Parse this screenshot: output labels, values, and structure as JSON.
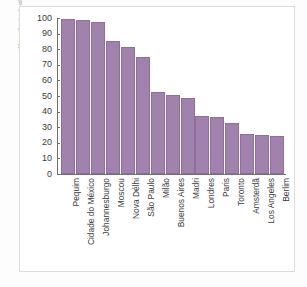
{
  "credit": {
    "text": "Allmaps/Arquivo da editora"
  },
  "chart_data": {
    "type": "bar",
    "title": "",
    "subtitle": "",
    "xlabel": "",
    "ylabel": "",
    "ylim": [
      0,
      100
    ],
    "grid": false,
    "legend": "none",
    "bar_color": "#a082ad",
    "bar_edge_color": "#8f6d9c",
    "axis_color": "#6e6e6e",
    "yticks": [
      0,
      10,
      20,
      30,
      40,
      50,
      60,
      70,
      80,
      90,
      100
    ],
    "ytick_labels": [
      "0",
      "10",
      "20",
      "30",
      "40",
      "50",
      "60",
      "70",
      "80",
      "90",
      "100"
    ],
    "categories": [
      "Pequim",
      "Cidade do México",
      "Johannesburgo",
      "Moscou",
      "Nova Délhi",
      "São Paulo",
      "Milão",
      "Buenos Aires",
      "Madri",
      "Londres",
      "Paris",
      "Toronto",
      "Amsterdã",
      "Los Angeles",
      "Berlim"
    ],
    "values": [
      99.5,
      99,
      97.5,
      85,
      81.5,
      75,
      52.5,
      50.5,
      48.5,
      37,
      36.5,
      32.5,
      25.5,
      25.3,
      24.5
    ]
  }
}
